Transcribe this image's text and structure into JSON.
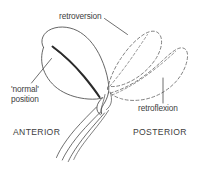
{
  "figure": {
    "name": "uterine-position-diagram",
    "background_color": "#ffffff",
    "line_color": "#4a4a4a",
    "text_color": "#3d3d3d",
    "cavity_color": "#2b2b2b"
  },
  "labels": {
    "retroversion": "retroversion",
    "normal_position_line1": "'normal'",
    "normal_position_line2": "position",
    "retroflexion": "retroflexion",
    "anterior": "ANTERIOR",
    "posterior": "POSTERIOR"
  },
  "elements": {
    "normal_uterus_name": "normal-position-uterus-outline",
    "uterine_cavity_name": "uterine-cavity-line",
    "retroversion_shape_name": "retroversion-uterus-dashed-outline",
    "retroflexion_shape_name": "retroflexion-uterus-dashed-outline",
    "vaginal_canal_name": "vaginal-canal-lines",
    "cervix_name": "cervix-outline"
  }
}
